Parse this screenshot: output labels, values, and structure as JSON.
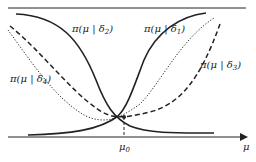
{
  "figure": {
    "type": "diagram",
    "axis": {
      "x_label": "μ",
      "origin_label": "μ",
      "origin_sub": "0"
    },
    "curves": [
      {
        "id": "delta1",
        "label": "π(μ | δ",
        "sub": "1",
        "close": ")",
        "style": "solid",
        "direction": "increasing"
      },
      {
        "id": "delta2",
        "label": "π(μ | δ",
        "sub": "2",
        "close": ")",
        "style": "solid",
        "direction": "decreasing"
      },
      {
        "id": "delta3",
        "label": "π(μ | δ",
        "sub": "3",
        "close": ")",
        "style": "dashed",
        "direction": "U-shaped"
      },
      {
        "id": "delta4",
        "label": "π(μ | δ",
        "sub": "4",
        "close": ")",
        "style": "dotted",
        "direction": "U-shaped"
      }
    ],
    "colors": {
      "line": "#222222",
      "background": "#ffffff"
    }
  }
}
